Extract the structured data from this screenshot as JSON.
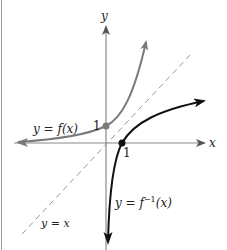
{
  "figure": {
    "axes": {
      "x_label": "x",
      "y_label": "y"
    },
    "labels": {
      "f": "y = f(x)",
      "finv_prefix": "y = f",
      "finv_sup": "−1",
      "finv_suffix": "(x)",
      "identity": "y = x",
      "tick_y_one": "1",
      "tick_x_one": "1"
    },
    "colors": {
      "f_curve": "#7a7a7a",
      "finv_curve": "#111111",
      "identity_line": "#9a9a9a",
      "axes": "#8a8a8a",
      "f_point": "#7a7a7a",
      "finv_point": "#111111"
    },
    "points": [
      {
        "name": "f-intercept",
        "x": 0,
        "y": 1
      },
      {
        "name": "finv-intercept",
        "x": 1,
        "y": 0
      }
    ]
  }
}
